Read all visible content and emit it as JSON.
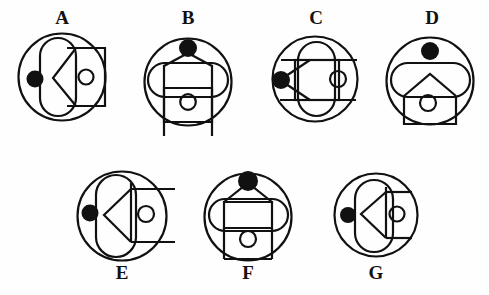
{
  "page": {
    "background_color": "#fefefe",
    "ink_color": "#111111",
    "width": 489,
    "height": 295
  },
  "labels": {
    "a": "A",
    "b": "B",
    "c": "C",
    "d": "D",
    "e": "E",
    "f": "F",
    "g": "G"
  },
  "faint_artifact": {
    "left_margin_text": ""
  },
  "figures": [
    {
      "id": "figure-a",
      "label": "A",
      "row": 1,
      "column": 1,
      "outer_circle": {
        "cx": 62,
        "cy": 77,
        "r": 44
      },
      "dot": {
        "cx": 35,
        "cy": 79,
        "r": 8.5,
        "position": "left-inside"
      },
      "elements": [
        "vertical-stadium",
        "left-pointing-chevron",
        "rectangle-with-small-circle",
        "black-dot"
      ],
      "small_circle": {
        "cx": 86,
        "cy": 77,
        "r": 7.5
      }
    },
    {
      "id": "figure-b",
      "label": "B",
      "row": 1,
      "column": 2,
      "outer_circle": {
        "cx": 188,
        "cy": 82,
        "r": 44
      },
      "dot": {
        "cx": 188,
        "cy": 48,
        "r": 9,
        "position": "top-inside"
      },
      "elements": [
        "horizontal-stadium",
        "house-pentagon",
        "rectangle-with-small-circle",
        "two-vertical-legs",
        "black-dot"
      ],
      "small_circle": {
        "cx": 188,
        "cy": 100,
        "r": 8
      }
    },
    {
      "id": "figure-c",
      "label": "C",
      "row": 1,
      "column": 3,
      "outer_circle": {
        "cx": 315,
        "cy": 78,
        "r": 43
      },
      "dot": {
        "cx": 281,
        "cy": 80,
        "r": 9,
        "position": "left-inside"
      },
      "elements": [
        "vertical-stadium",
        "rectangle",
        "two-horizontal-lines",
        "left-pointing-triangle-from-dot",
        "small-circle",
        "black-dot"
      ],
      "small_circle": {
        "cx": 337,
        "cy": 79,
        "r": 8
      }
    },
    {
      "id": "figure-d",
      "label": "D",
      "row": 1,
      "column": 4,
      "outer_circle": {
        "cx": 430,
        "cy": 80,
        "r": 44
      },
      "dot": {
        "cx": 430,
        "cy": 51,
        "r": 9,
        "position": "top-inside"
      },
      "elements": [
        "horizontal-stadium",
        "house-pentagon",
        "box-with-small-circle",
        "black-dot"
      ],
      "small_circle": {
        "cx": 428,
        "cy": 101,
        "r": 8
      }
    },
    {
      "id": "figure-e",
      "label": "E",
      "row": 2,
      "column": 1,
      "outer_circle": {
        "cx": 122,
        "cy": 215,
        "r": 45
      },
      "dot": {
        "cx": 90,
        "cy": 213,
        "r": 8.5,
        "position": "left-inside"
      },
      "elements": [
        "vertical-stadium",
        "left-pointing-chevron",
        "two-long-horizontal-lines-extending-right",
        "vertical-line",
        "small-circle",
        "black-dot"
      ],
      "small_circle": {
        "cx": 145,
        "cy": 213,
        "r": 8
      }
    },
    {
      "id": "figure-f",
      "label": "F",
      "row": 2,
      "column": 2,
      "outer_circle": {
        "cx": 248,
        "cy": 216,
        "r": 44
      },
      "dot": {
        "cx": 248,
        "cy": 181,
        "r": 10,
        "position": "top-inside"
      },
      "elements": [
        "horizontal-stadium",
        "triangle-roof-from-dot",
        "rectangle-with-small-circle",
        "two-vertical-legs",
        "black-dot"
      ],
      "small_circle": {
        "cx": 248,
        "cy": 236,
        "r": 8
      }
    },
    {
      "id": "figure-g",
      "label": "G",
      "row": 2,
      "column": 3,
      "outer_circle": {
        "cx": 376,
        "cy": 215,
        "r": 42
      },
      "dot": {
        "cx": 348,
        "cy": 215,
        "r": 8,
        "position": "left-inside"
      },
      "elements": [
        "vertical-stadium",
        "left-pointing-chevron",
        "two-short-horizontal-lines",
        "vertical-line",
        "small-circle",
        "black-dot"
      ],
      "small_circle": {
        "cx": 396,
        "cy": 214,
        "r": 7.5
      }
    }
  ],
  "label_positions": [
    {
      "label": "A",
      "x": 49,
      "y": 8
    },
    {
      "label": "B",
      "x": 175,
      "y": 8
    },
    {
      "label": "C",
      "x": 303,
      "y": 8
    },
    {
      "label": "D",
      "x": 419,
      "y": 8
    },
    {
      "label": "E",
      "x": 109,
      "y": 263
    },
    {
      "label": "F",
      "x": 235,
      "y": 263
    },
    {
      "label": "G",
      "x": 363,
      "y": 263
    }
  ]
}
